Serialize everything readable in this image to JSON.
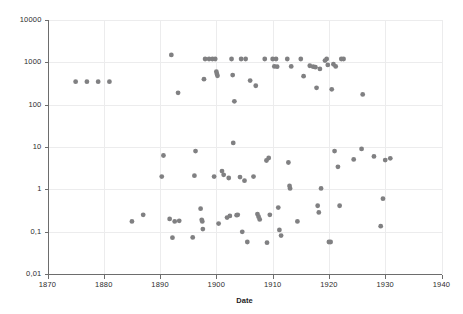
{
  "chart_data": {
    "type": "scatter",
    "title": "",
    "xlabel": "Date",
    "ylabel": "",
    "xlim": [
      1870,
      1940
    ],
    "ylim": [
      0.01,
      10000
    ],
    "yscale": "log",
    "xscale": "linear",
    "grid": true,
    "legend": null,
    "marker": {
      "shape": "circle",
      "color": "#808082",
      "size": 5
    },
    "xticks": [
      1870,
      1880,
      1890,
      1900,
      1910,
      1920,
      1930,
      1940
    ],
    "xtick_labels": [
      "1870",
      "1880",
      "1890",
      "1900",
      "1910",
      "1920",
      "1930",
      "1940"
    ],
    "yticks": [
      0.01,
      0.1,
      1,
      10,
      100,
      1000,
      10000
    ],
    "ytick_labels": [
      "0,01",
      "0,1",
      "1",
      "10",
      "100",
      "1000",
      "10000"
    ],
    "decimal_separator": ",",
    "series": [
      {
        "name": "observations",
        "points": [
          [
            1875.0,
            350
          ],
          [
            1877.0,
            350
          ],
          [
            1879.0,
            350
          ],
          [
            1881.0,
            350
          ],
          [
            1885.0,
            0.175
          ],
          [
            1887.0,
            0.25
          ],
          [
            1890.3,
            2.0
          ],
          [
            1890.6,
            6.3
          ],
          [
            1891.7,
            0.2
          ],
          [
            1892.0,
            1500
          ],
          [
            1892.2,
            0.072
          ],
          [
            1892.6,
            0.175
          ],
          [
            1893.2,
            190
          ],
          [
            1893.4,
            0.18
          ],
          [
            1895.8,
            0.073
          ],
          [
            1896.1,
            2.1
          ],
          [
            1896.3,
            8.0
          ],
          [
            1897.2,
            0.35
          ],
          [
            1897.4,
            0.19
          ],
          [
            1897.5,
            0.175
          ],
          [
            1897.6,
            0.115
          ],
          [
            1897.8,
            400
          ],
          [
            1898.0,
            1200
          ],
          [
            1898.7,
            1200
          ],
          [
            1899.3,
            1200
          ],
          [
            1899.6,
            2.0
          ],
          [
            1899.8,
            1200
          ],
          [
            1900.0,
            600
          ],
          [
            1900.1,
            530
          ],
          [
            1900.2,
            480
          ],
          [
            1900.4,
            0.155
          ],
          [
            1901.0,
            2.7
          ],
          [
            1901.3,
            2.2
          ],
          [
            1901.9,
            0.215
          ],
          [
            1902.2,
            1.85
          ],
          [
            1902.4,
            0.235
          ],
          [
            1902.7,
            1200
          ],
          [
            1902.9,
            500
          ],
          [
            1903.0,
            12.5
          ],
          [
            1903.2,
            120
          ],
          [
            1903.6,
            0.245
          ],
          [
            1903.8,
            0.25
          ],
          [
            1904.2,
            1.95
          ],
          [
            1904.4,
            1200
          ],
          [
            1904.6,
            0.099
          ],
          [
            1905.0,
            1.6
          ],
          [
            1905.2,
            1200
          ],
          [
            1905.5,
            0.057
          ],
          [
            1906.0,
            370
          ],
          [
            1906.6,
            2.0
          ],
          [
            1907.0,
            280
          ],
          [
            1907.3,
            0.26
          ],
          [
            1907.5,
            0.225
          ],
          [
            1907.7,
            0.195
          ],
          [
            1908.6,
            1200
          ],
          [
            1908.9,
            4.8
          ],
          [
            1909.0,
            0.055
          ],
          [
            1909.3,
            5.5
          ],
          [
            1909.5,
            0.25
          ],
          [
            1910.0,
            1200
          ],
          [
            1910.3,
            800
          ],
          [
            1910.6,
            1200
          ],
          [
            1910.8,
            790
          ],
          [
            1911.0,
            0.37
          ],
          [
            1911.2,
            0.11
          ],
          [
            1911.5,
            0.081
          ],
          [
            1912.6,
            1200
          ],
          [
            1912.8,
            4.3
          ],
          [
            1913.0,
            1.2
          ],
          [
            1913.1,
            1.05
          ],
          [
            1913.3,
            800
          ],
          [
            1914.4,
            0.175
          ],
          [
            1915.0,
            1200
          ],
          [
            1915.5,
            470
          ],
          [
            1916.6,
            830
          ],
          [
            1917.2,
            790
          ],
          [
            1917.6,
            770
          ],
          [
            1917.8,
            250
          ],
          [
            1918.0,
            0.41
          ],
          [
            1918.2,
            0.285
          ],
          [
            1918.4,
            700
          ],
          [
            1918.6,
            1.05
          ],
          [
            1919.3,
            1100
          ],
          [
            1919.6,
            1200
          ],
          [
            1919.8,
            870
          ],
          [
            1920.0,
            0.057
          ],
          [
            1920.3,
            0.057
          ],
          [
            1920.5,
            230
          ],
          [
            1920.8,
            900
          ],
          [
            1921.0,
            8.0
          ],
          [
            1921.2,
            800
          ],
          [
            1921.6,
            3.4
          ],
          [
            1921.9,
            0.41
          ],
          [
            1922.2,
            1200
          ],
          [
            1922.6,
            1200
          ],
          [
            1924.4,
            5.1
          ],
          [
            1925.8,
            9.0
          ],
          [
            1926.0,
            175
          ],
          [
            1928.0,
            6.0
          ],
          [
            1929.2,
            0.135
          ],
          [
            1929.6,
            0.6
          ],
          [
            1930.0,
            4.9
          ],
          [
            1930.9,
            5.4
          ]
        ]
      }
    ]
  },
  "axis": {
    "x_title": "Date"
  }
}
